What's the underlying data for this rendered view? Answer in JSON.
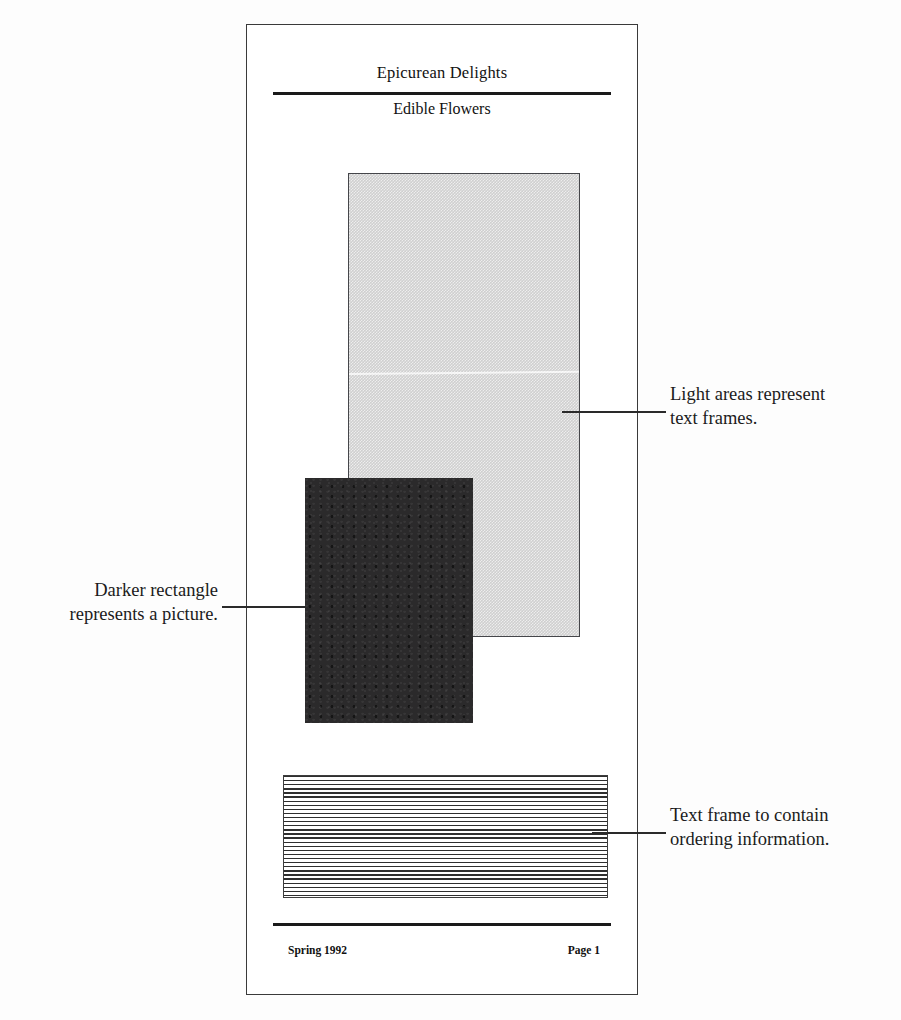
{
  "document": {
    "title": "Epicurean Delights",
    "subtitle": "Edible Flowers",
    "footer_left": "Spring 1992",
    "footer_right": "Page 1"
  },
  "annotations": [
    {
      "id": "text-frames",
      "line1": "Light areas represent",
      "line2": "text frames."
    },
    {
      "id": "picture",
      "line1": "Darker rectangle",
      "line2": "represents a picture."
    },
    {
      "id": "ordering",
      "line1": "Text frame to contain",
      "line2": "ordering information."
    }
  ],
  "frames": {
    "light_text_frame": {
      "fill": "#cfcfcf",
      "border": "#45464a"
    },
    "dark_picture_frame": {
      "fill": "#2b2a2b"
    },
    "ruled_ordering_frame": {
      "rule_color": "#2f2f2f",
      "border": "#3d3d3d"
    }
  },
  "colors": {
    "page_background": "#ffffff",
    "page_border": "#3a3a3a",
    "rule": "#1a1a1a",
    "text": "#111111",
    "leader": "#2a2a2a"
  }
}
